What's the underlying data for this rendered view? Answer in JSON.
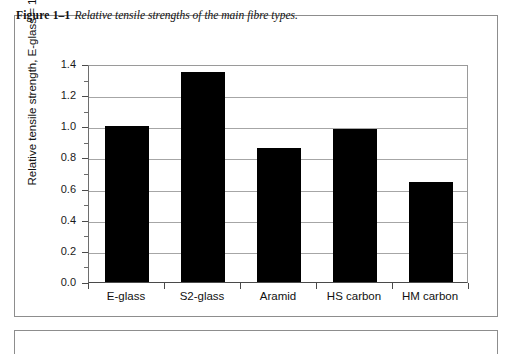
{
  "caption": {
    "figure_number": "Figure 1–1",
    "text": "Relative tensile strengths of the main fibre types."
  },
  "chart_data": {
    "type": "bar",
    "title": "Relative tensile strengths of the main fibre types.",
    "categories": [
      "E-glass",
      "S2-glass",
      "Aramid",
      "HS carbon",
      "HM carbon"
    ],
    "values": [
      1.0,
      1.35,
      0.86,
      0.98,
      0.64
    ],
    "series": [
      {
        "name": "Relative tensile strength",
        "values": [
          1.0,
          1.35,
          0.86,
          0.98,
          0.64
        ]
      }
    ],
    "xlabel": "",
    "ylabel": "Relative tensile strength, E-glass = 1",
    "ylim": [
      0.0,
      1.4
    ],
    "ytick_labels": [
      "0.0",
      "0.2",
      "0.4",
      "0.6",
      "0.8",
      "1.0",
      "1.2",
      "1.4"
    ],
    "ytick_values": [
      0.0,
      0.2,
      0.4,
      0.6,
      0.8,
      1.0,
      1.2,
      1.4
    ],
    "minor_tick_interval": 0.1,
    "grid": true,
    "grid_axis": "y",
    "legend": false,
    "bar_color": "#000000",
    "grid_color": "#a6a6a6",
    "axis_color": "#4a4a4a",
    "background": "#ffffff"
  }
}
